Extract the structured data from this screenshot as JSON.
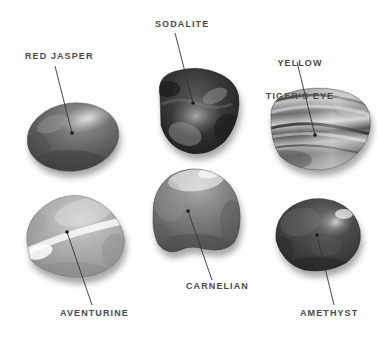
{
  "figure": {
    "type": "gemstone-identification-plate",
    "background_color": "#ffffff",
    "label_color": "#4a4a4a",
    "leader_line_color": "#333333",
    "specimen_count": 6
  },
  "specimens": [
    {
      "id": "red-jasper",
      "label": "RED JASPER",
      "label_x": 25,
      "label_y": 56,
      "label_align": "left",
      "leader": {
        "x1": 55,
        "y1": 66,
        "x2": 72,
        "y2": 133
      },
      "dot": {
        "cx": 72,
        "cy": 133,
        "r": 1.7
      },
      "stone": {
        "cx": 73,
        "cy": 137,
        "rx": 46,
        "ry": 34,
        "rotate": -8,
        "base": "#6f6f6f",
        "shade": "#4a4a4a",
        "highlight": "#c9c9c9",
        "shape": "oval"
      }
    },
    {
      "id": "sodalite",
      "label": "SODALITE",
      "label_x": 155,
      "label_y": 24,
      "label_align": "left",
      "leader": {
        "x1": 175,
        "y1": 33,
        "x2": 193,
        "y2": 103
      },
      "dot": {
        "cx": 193,
        "cy": 103,
        "r": 1.7
      },
      "stone": {
        "cx": 197,
        "cy": 112,
        "rx": 43,
        "ry": 42,
        "rotate": 6,
        "base": "#3c3c3c",
        "shade": "#1e1e1e",
        "highlight": "#a8a8a8",
        "shape": "blob"
      }
    },
    {
      "id": "yellow-tigers-eye",
      "label": "YELLOW\nTIGER'S EYE",
      "label_line1": "YELLOW",
      "label_line2": "TIGER'S EYE",
      "label_x": 268,
      "label_y": 38,
      "label_align": "center",
      "leader": {
        "x1": 297,
        "y1": 62,
        "x2": 315,
        "y2": 135
      },
      "dot": {
        "cx": 315,
        "cy": 135,
        "r": 1.7
      },
      "stone": {
        "cx": 318,
        "cy": 130,
        "rx": 51,
        "ry": 40,
        "rotate": -10,
        "base": "#8d8d8d",
        "shade": "#5a5a5a",
        "highlight": "#dedede",
        "shape": "banded"
      }
    },
    {
      "id": "aventurine",
      "label": "AVENTURINE",
      "label_x": 60,
      "label_y": 313,
      "label_align": "left",
      "leader": {
        "x1": 67,
        "y1": 232,
        "x2": 92,
        "y2": 305
      },
      "dot": {
        "cx": 67,
        "cy": 232,
        "r": 1.7
      },
      "stone": {
        "cx": 73,
        "cy": 237,
        "rx": 50,
        "ry": 40,
        "rotate": -4,
        "base": "#a9a9a9",
        "shade": "#8a8a8a",
        "highlight": "#f1f1f1",
        "shape": "triangle-round"
      }
    },
    {
      "id": "carnelian",
      "label": "CARNELIAN",
      "label_x": 186,
      "label_y": 286,
      "label_align": "left",
      "leader": {
        "x1": 188,
        "y1": 211,
        "x2": 212,
        "y2": 280
      },
      "dot": {
        "cx": 188,
        "cy": 211,
        "r": 1.7
      },
      "stone": {
        "cx": 196,
        "cy": 209,
        "rx": 44,
        "ry": 42,
        "rotate": 2,
        "base": "#767676",
        "shade": "#525252",
        "highlight": "#e6e6e6",
        "shape": "dome"
      }
    },
    {
      "id": "amethyst",
      "label": "AMETHYST",
      "label_x": 300,
      "label_y": 313,
      "label_align": "left",
      "leader": {
        "x1": 317,
        "y1": 235,
        "x2": 334,
        "y2": 305
      },
      "dot": {
        "cx": 317,
        "cy": 235,
        "r": 1.7
      },
      "stone": {
        "cx": 318,
        "cy": 236,
        "rx": 43,
        "ry": 36,
        "rotate": -6,
        "base": "#4f4f4f",
        "shade": "#303030",
        "highlight": "#cccccc",
        "shape": "oval"
      }
    }
  ]
}
